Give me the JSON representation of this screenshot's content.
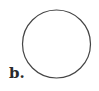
{
  "figure": {
    "label": "b.",
    "shape": {
      "type": "circle",
      "cx": 56.5,
      "cy": 44,
      "r": 34,
      "stroke": "#444444",
      "fill": "#ffffff"
    }
  }
}
